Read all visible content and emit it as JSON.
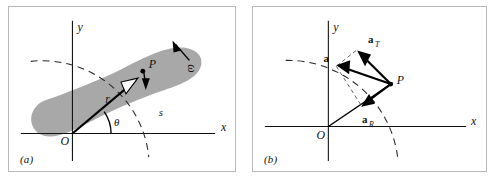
{
  "figure": {
    "type": "physics-diagram",
    "background_color": "#ffffff",
    "border_color": "#b9b9b9",
    "body_fill_color": "#a8a8a8",
    "ink_color": "#111111"
  },
  "panels": [
    {
      "id": "a",
      "caption": "(a)",
      "axes": {
        "x_label": "x",
        "y_label": "y",
        "origin_label": "O"
      },
      "labels": {
        "point": "P",
        "radius_vector": "r",
        "arc_length": "s",
        "angle": "θ",
        "angular_marker": "ω"
      }
    },
    {
      "id": "b",
      "caption": "(b)",
      "axes": {
        "x_label": "x",
        "y_label": "y",
        "origin_label": "O"
      },
      "labels": {
        "point": "P",
        "acceleration": "a",
        "tangential_acceleration": "a",
        "tangential_subscript": "T",
        "radial_acceleration": "a",
        "radial_subscript": "R"
      }
    }
  ]
}
